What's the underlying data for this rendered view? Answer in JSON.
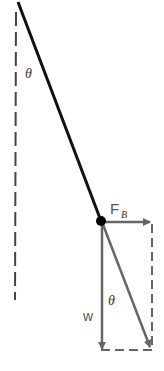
{
  "diagram": {
    "title": "",
    "labels": {
      "angle_top": "θ",
      "buoyant_force": "F",
      "buoyant_force_sub": "B",
      "angle_bottom": "θ",
      "weight": "w"
    },
    "colors": {
      "string": "#111111",
      "vector": "#666666",
      "dashed": "#333333",
      "ball": "#000000"
    }
  }
}
